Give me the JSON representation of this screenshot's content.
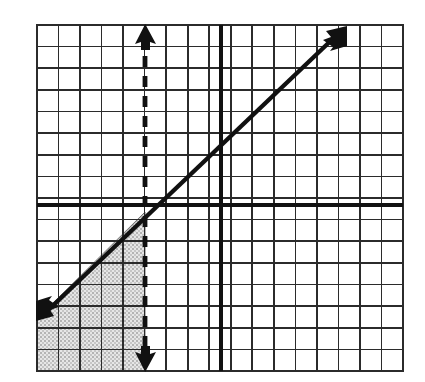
{
  "figure": {
    "background_color": "#ffffff",
    "grid": {
      "line_color": "#2b2b2b",
      "minor_line_width": 1.6,
      "border_line_width": 2.2,
      "columns": 17,
      "rows": 16,
      "cell_size_px": 21.5,
      "left_px": 37,
      "top_px": 25,
      "right_px": 403,
      "bottom_px": 371
    },
    "axes": {
      "color": "#111111",
      "line_width": 4.0,
      "x_axis_y_px": 205,
      "y_axis_x_px": 221,
      "origin_label": "",
      "tick_labels": []
    },
    "solid_line": {
      "name": "diagonal-line",
      "color": "#111111",
      "line_width": 4.4,
      "style": "solid",
      "slope": 1,
      "arrow_both_ends": true,
      "start_px": [
        38,
        320
      ],
      "end_px": [
        345,
        27
      ]
    },
    "dashed_line": {
      "name": "vertical-boundary-line",
      "color": "#111111",
      "line_width": 4.8,
      "style": "dashed",
      "dash_pattern": "11 9",
      "orientation": "vertical",
      "x_px": 145,
      "arrow_both_ends": true,
      "top_px": 27,
      "bottom_px": 369
    },
    "shaded_region": {
      "name": "solution-region",
      "fill_color": "#d6d6d6",
      "fill_style": "stipple-dots",
      "dot_color": "#9a9a9a",
      "edge_color": "#6f6f6f",
      "vertices_px": [
        [
          37,
          319
        ],
        [
          145,
          212
        ],
        [
          145,
          371
        ],
        [
          37,
          371
        ]
      ],
      "description": "Region below the solid diagonal line and left of the dashed vertical line"
    }
  }
}
